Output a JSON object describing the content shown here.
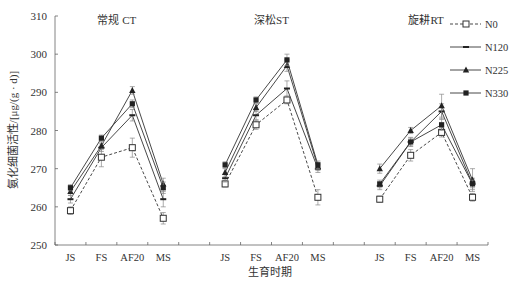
{
  "chart_data": {
    "type": "line",
    "title": "",
    "xlabel": "生育时期",
    "ylabel": "氨化细菌活性/[μg/(g · d)]",
    "ylim": [
      250,
      310
    ],
    "yticks": [
      250,
      260,
      270,
      280,
      290,
      300,
      310
    ],
    "grid": false,
    "legend_position": "top-right",
    "panels": [
      {
        "title": "常规 CT",
        "categories": [
          "JS",
          "FS",
          "AF20",
          "MS"
        ],
        "series": [
          {
            "name": "N0",
            "values": [
              259,
              273,
              275.5,
              257
            ],
            "errors": [
              1,
              2.5,
              2.5,
              1.5
            ]
          },
          {
            "name": "N120",
            "values": [
              262,
              275.5,
              284,
              262
            ],
            "errors": [
              1,
              1,
              1.5,
              2
            ]
          },
          {
            "name": "N225",
            "values": [
              264,
              276,
              290.5,
              266
            ],
            "errors": [
              1,
              1,
              1,
              1.5
            ]
          },
          {
            "name": "N330",
            "values": [
              265,
              278,
              287,
              265
            ],
            "errors": [
              0.8,
              0.8,
              1,
              1.5
            ]
          }
        ]
      },
      {
        "title": "深松ST",
        "categories": [
          "JS",
          "FS",
          "AF20",
          "MS"
        ],
        "series": [
          {
            "name": "N0",
            "values": [
              266,
              281.5,
              288,
              262.5
            ],
            "errors": [
              0.8,
              1.2,
              1,
              2
            ]
          },
          {
            "name": "N120",
            "values": [
              267.5,
              284,
              291,
              270
            ],
            "errors": [
              1,
              1.2,
              2,
              1
            ]
          },
          {
            "name": "N225",
            "values": [
              269,
              286,
              297,
              270.5
            ],
            "errors": [
              1,
              1,
              1.5,
              1
            ]
          },
          {
            "name": "N330",
            "values": [
              271,
              288,
              298.5,
              271
            ],
            "errors": [
              0.8,
              0.8,
              1.5,
              1
            ]
          }
        ]
      },
      {
        "title": "旋耕RT",
        "categories": [
          "JS",
          "FS",
          "AF20",
          "MS"
        ],
        "series": [
          {
            "name": "N0",
            "values": [
              262,
              273.5,
              279.5,
              262.5
            ],
            "errors": [
              0.8,
              1.5,
              1.2,
              1
            ]
          },
          {
            "name": "N120",
            "values": [
              265.5,
              277,
              285,
              266
            ],
            "errors": [
              1,
              1,
              2,
              1.5
            ]
          },
          {
            "name": "N225",
            "values": [
              270,
              280,
              286.5,
              267
            ],
            "errors": [
              1.2,
              0.8,
              3,
              3
            ]
          },
          {
            "name": "N330",
            "values": [
              266,
              277,
              281.5,
              266
            ],
            "errors": [
              1,
              1.2,
              1.5,
              1
            ]
          }
        ]
      }
    ],
    "legend": [
      {
        "name": "N0",
        "line": "dashed",
        "marker": "open-square"
      },
      {
        "name": "N120",
        "line": "solid",
        "marker": "dash"
      },
      {
        "name": "N225",
        "line": "solid",
        "marker": "filled-triangle"
      },
      {
        "name": "N330",
        "line": "solid",
        "marker": "filled-circle"
      }
    ]
  }
}
